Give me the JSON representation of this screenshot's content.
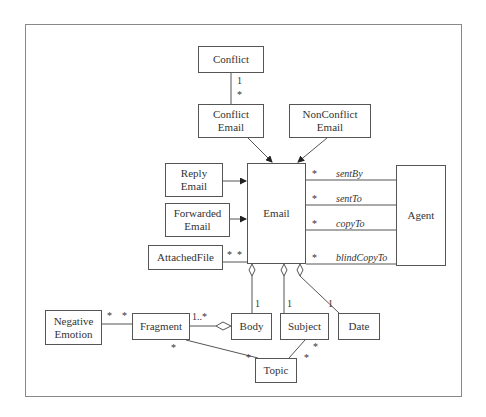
{
  "diagram": {
    "type": "UML class diagram",
    "classes": {
      "conflict": "Conflict",
      "conflict_email": [
        "Conflict",
        "Email"
      ],
      "nonconflict_email": [
        "NonConflict",
        "Email"
      ],
      "reply_email": [
        "Reply",
        "Email"
      ],
      "forwarded_email": [
        "Forwarded",
        "Email"
      ],
      "attached_file": "AttachedFile",
      "email": "Email",
      "agent": "Agent",
      "negative_emotion": [
        "Negative",
        "Emotion"
      ],
      "fragment": "Fragment",
      "body": "Body",
      "subject": "Subject",
      "date": "Date",
      "topic": "Topic"
    },
    "roles": {
      "sent_by": "sentBy",
      "sent_to": "sentTo",
      "copy_to": "copyTo",
      "blind_copy_to": "blindCopyTo"
    },
    "multiplicities": {
      "conflict_one": "1",
      "conflict_many": "*",
      "sent_by": "*",
      "sent_to": "*",
      "copy_to": "*",
      "blind_copy_to": "*",
      "attached_left": "*",
      "attached_right": "*",
      "body_one": "1",
      "subject_one": "1",
      "date_one": "1",
      "fragment_body": "1..*",
      "neg_left": "*",
      "neg_right": "*",
      "fragment_topic": "*",
      "topic_fragment": "*",
      "subject_topic": "*",
      "topic_subject": "*"
    },
    "colors": {
      "line": "#555555",
      "frame": "#888888",
      "text": "#333333"
    }
  }
}
